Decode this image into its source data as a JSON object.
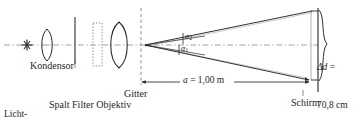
{
  "figure": {
    "kind": "optics-ray-diagram",
    "background_color": "#ffffff",
    "line_color": "#262626",
    "axis_style": "dash-dot"
  },
  "labels": {
    "kondensor": "Kondensor",
    "lichtquelle_line1": "Licht-",
    "lichtquelle_line2": "quelle",
    "spalt_filter_objektiv": "Spalt Filter Objektiv",
    "gitter": "Gitter",
    "schirm": "Schirm"
  },
  "annotations": {
    "distance_symbol": "a",
    "distance_equals": " = ",
    "distance_value": "1,00 m",
    "distance_full": "a = 1,00 m",
    "spread_symbol": "Δd",
    "spread_equals": " =",
    "spread_value": "70,8 cm",
    "spread_full": "Δd = 70,8 cm",
    "angle_upper_symbol": "α",
    "angle_upper_subscript": "2",
    "angle_lower_symbol": "α",
    "angle_lower_subscript": "1"
  },
  "components": {
    "light_source": "star-glyph",
    "condenser_lens": "biconvex-lens-small",
    "slit": "vertical-solid-line",
    "filter": "dotted-rectangle",
    "objective_lens": "biconvex-lens-large",
    "grating": "vertical-dashed-line",
    "screen": "vertical-solid-line",
    "brace": "curly-brace-right"
  },
  "icons": {
    "light_source_icon": "star-icon",
    "condenser_icon": "lens-icon",
    "objective_icon": "lens-icon",
    "slit_icon": "slit-icon",
    "filter_icon": "filter-icon",
    "grating_icon": "grating-icon",
    "screen_icon": "screen-icon",
    "dimension_icon": "double-arrow-icon",
    "brace_icon": "brace-icon"
  }
}
